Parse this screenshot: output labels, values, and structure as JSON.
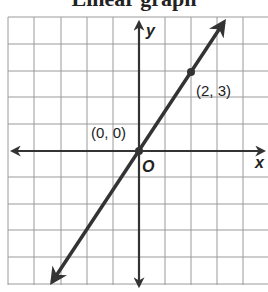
{
  "heading": "Linear graph",
  "graph": {
    "x_axis_label": "x",
    "y_axis_label": "y",
    "origin_label": "O",
    "points": [
      {
        "label": "(0, 0)",
        "x": 0,
        "y": 0
      },
      {
        "label": "(2, 3)",
        "x": 2,
        "y": 3
      }
    ],
    "line_color": "#333333",
    "grid_color": "#9a9a9a"
  }
}
